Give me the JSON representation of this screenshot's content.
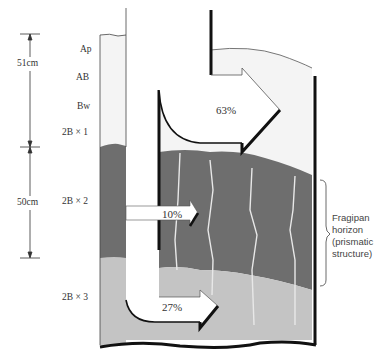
{
  "diagram": {
    "depth_labels": {
      "upper": "51cm",
      "lower": "50cm"
    },
    "horizons": [
      {
        "name": "Ap"
      },
      {
        "name": "AB"
      },
      {
        "name": "Bw"
      },
      {
        "name": "2B × 1"
      },
      {
        "name": "2B × 2"
      },
      {
        "name": "2B × 3"
      }
    ],
    "flows": [
      {
        "label": "63%"
      },
      {
        "label": "10%"
      },
      {
        "label": "27%"
      }
    ],
    "annotation": {
      "line1": "Fragipan",
      "line2": "horizon",
      "line3": "(prismatic",
      "line4": "structure)"
    },
    "colors": {
      "upper_soil": "#f4f4f4",
      "fragipan": "#6e6e6e",
      "lower_soil": "#c4c4c4",
      "outline": "#111111"
    }
  }
}
